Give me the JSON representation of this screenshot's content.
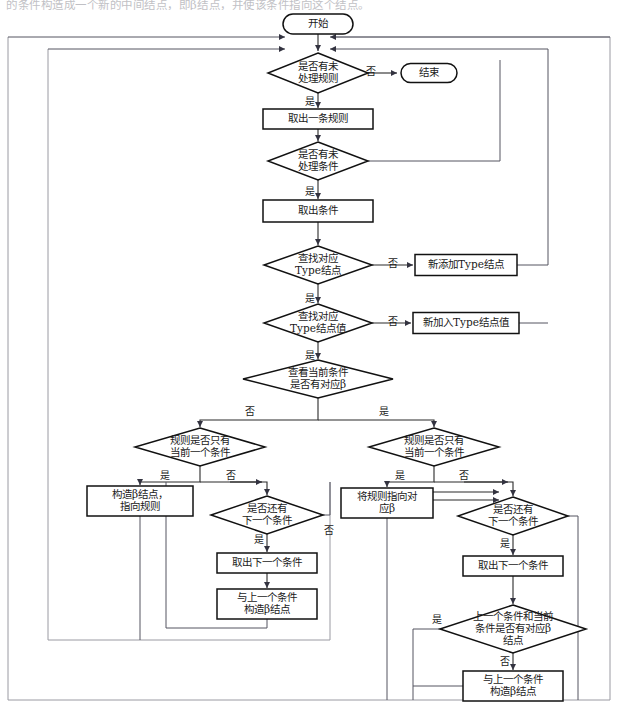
{
  "page": {
    "cutoff_text_line": "的条件构造成一个新的中间结点，即β结点，并使该条件指向这个结点。",
    "width": 619,
    "height": 712,
    "background": "#ffffff",
    "line_color": "#111111",
    "frame_color": "#9a9aa2",
    "connector_color": "#555560"
  },
  "flowchart": {
    "type": "flowchart",
    "title": "规则编译流程图",
    "nodes": [
      {
        "id": "start",
        "shape": "terminator",
        "label": "开始",
        "cx": 318,
        "cy": 24,
        "w": 70,
        "h": 20
      },
      {
        "id": "has_rule",
        "shape": "decision",
        "label": "是否有未\n处理规则",
        "cx": 318,
        "cy": 73,
        "w": 100,
        "h": 40
      },
      {
        "id": "end",
        "shape": "terminator",
        "label": "结束",
        "cx": 429,
        "cy": 73,
        "w": 56,
        "h": 19
      },
      {
        "id": "take_rule",
        "shape": "process",
        "label": "取出一条规则",
        "cx": 318,
        "cy": 119,
        "w": 110,
        "h": 20
      },
      {
        "id": "has_cond",
        "shape": "decision",
        "label": "是否有未\n处理条件",
        "cx": 318,
        "cy": 161,
        "w": 100,
        "h": 38
      },
      {
        "id": "take_cond",
        "shape": "process",
        "label": "取出条件",
        "cx": 318,
        "cy": 211,
        "w": 110,
        "h": 22
      },
      {
        "id": "find_type",
        "shape": "decision",
        "label": "查找对应\nType结点",
        "cx": 318,
        "cy": 265,
        "w": 108,
        "h": 38
      },
      {
        "id": "add_type",
        "shape": "process",
        "label": "新添加Type结点",
        "cx": 466,
        "cy": 265,
        "w": 102,
        "h": 21
      },
      {
        "id": "find_typeval",
        "shape": "decision",
        "label": "查找对应\nType结点值",
        "cx": 318,
        "cy": 323,
        "w": 108,
        "h": 38
      },
      {
        "id": "add_typeval",
        "shape": "process",
        "label": "新加入Type结点值",
        "cx": 466,
        "cy": 323,
        "w": 106,
        "h": 21
      },
      {
        "id": "cur_has_beta",
        "shape": "decision",
        "label": "查看当前条件\n是否有对应β",
        "cx": 318,
        "cy": 379,
        "w": 150,
        "h": 38
      },
      {
        "id": "left_only_one",
        "shape": "decision",
        "label": "规则是否只有\n当前一个条件",
        "cx": 200,
        "cy": 447,
        "w": 130,
        "h": 38
      },
      {
        "id": "build_beta",
        "shape": "process",
        "label": "构造β结点，\n指向规则",
        "cx": 140,
        "cy": 501,
        "w": 106,
        "h": 30
      },
      {
        "id": "left_next",
        "shape": "decision",
        "label": "是否还有\n下一个条件",
        "cx": 267,
        "cy": 515,
        "w": 112,
        "h": 38
      },
      {
        "id": "left_takenext",
        "shape": "process",
        "label": "取出下一个条件",
        "cx": 267,
        "cy": 563,
        "w": 100,
        "h": 20
      },
      {
        "id": "left_mkbeta",
        "shape": "process",
        "label": "与上一个条件\n构造β结点",
        "cx": 267,
        "cy": 604,
        "w": 100,
        "h": 30
      },
      {
        "id": "right_only_one",
        "shape": "decision",
        "label": "规则是否只有\n当前一个条件",
        "cx": 434,
        "cy": 447,
        "w": 130,
        "h": 38
      },
      {
        "id": "point_beta",
        "shape": "process",
        "label": "将规则指向对\n应β",
        "cx": 387,
        "cy": 503,
        "w": 92,
        "h": 30
      },
      {
        "id": "right_next",
        "shape": "decision",
        "label": "是否还有\n下一个条件",
        "cx": 513,
        "cy": 516,
        "w": 110,
        "h": 38
      },
      {
        "id": "right_takenext",
        "shape": "process",
        "label": "取出下一个条件",
        "cx": 513,
        "cy": 566,
        "w": 100,
        "h": 20
      },
      {
        "id": "prev_cur_beta",
        "shape": "decision",
        "label": "上一个条件和当前\n条件是否有对应β\n结点",
        "cx": 513,
        "cy": 629,
        "w": 146,
        "h": 48
      },
      {
        "id": "right_mkbeta",
        "shape": "process",
        "label": "与上一个条件\n构造β结点",
        "cx": 513,
        "cy": 686,
        "w": 100,
        "h": 30
      }
    ],
    "edge_labels": [
      {
        "id": "no1",
        "text": "否",
        "x": 371,
        "y": 72
      },
      {
        "id": "yes1",
        "text": "是",
        "x": 310,
        "y": 102
      },
      {
        "id": "yes2",
        "text": "是",
        "x": 310,
        "y": 192
      },
      {
        "id": "no2",
        "text": "否",
        "x": 393,
        "y": 264
      },
      {
        "id": "yes3",
        "text": "是",
        "x": 310,
        "y": 299
      },
      {
        "id": "no3",
        "text": "否",
        "x": 393,
        "y": 322
      },
      {
        "id": "yes4",
        "text": "是",
        "x": 310,
        "y": 356
      },
      {
        "id": "nob",
        "text": "否",
        "x": 250,
        "y": 412
      },
      {
        "id": "yesb",
        "text": "是",
        "x": 384,
        "y": 412
      },
      {
        "id": "yesL",
        "text": "是",
        "x": 165,
        "y": 476
      },
      {
        "id": "noL",
        "text": "否",
        "x": 231,
        "y": 476
      },
      {
        "id": "yesL2",
        "text": "是",
        "x": 259,
        "y": 540
      },
      {
        "id": "noL2",
        "text": "否",
        "x": 329,
        "y": 531
      },
      {
        "id": "yesR",
        "text": "是",
        "x": 400,
        "y": 476
      },
      {
        "id": "noR",
        "text": "否",
        "x": 464,
        "y": 476
      },
      {
        "id": "yesR2",
        "text": "是",
        "x": 505,
        "y": 544
      },
      {
        "id": "yesR3",
        "text": "是",
        "x": 437,
        "y": 620
      },
      {
        "id": "noR3",
        "text": "否",
        "x": 505,
        "y": 662
      }
    ],
    "labels": {
      "start": "开始",
      "end": "结束",
      "yes": "是",
      "no": "否"
    }
  }
}
